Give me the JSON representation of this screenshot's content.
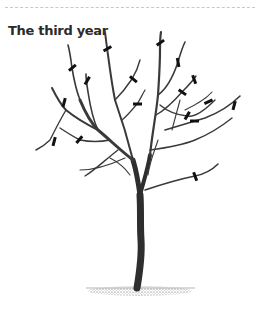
{
  "section": {
    "title": "The third year"
  },
  "figure": {
    "colors": {
      "branch": "#3a3a3a",
      "cut_mark": "#111111",
      "ground": "#555555"
    },
    "cut_marks": [
      {
        "x": 107,
        "y": 49,
        "angle": -30
      },
      {
        "x": 160,
        "y": 43,
        "angle": -35
      },
      {
        "x": 72,
        "y": 68,
        "angle": -40
      },
      {
        "x": 87,
        "y": 81,
        "angle": -60
      },
      {
        "x": 133,
        "y": 79,
        "angle": 40
      },
      {
        "x": 178,
        "y": 62,
        "angle": 80
      },
      {
        "x": 194,
        "y": 79,
        "angle": 70
      },
      {
        "x": 182,
        "y": 92,
        "angle": 35
      },
      {
        "x": 137,
        "y": 104,
        "angle": 0
      },
      {
        "x": 208,
        "y": 102,
        "angle": -25
      },
      {
        "x": 234,
        "y": 106,
        "angle": -75
      },
      {
        "x": 64,
        "y": 103,
        "angle": -75
      },
      {
        "x": 187,
        "y": 116,
        "angle": -60
      },
      {
        "x": 194,
        "y": 121,
        "angle": 0
      },
      {
        "x": 54,
        "y": 142,
        "angle": -75
      },
      {
        "x": 79,
        "y": 140,
        "angle": -50
      },
      {
        "x": 195,
        "y": 176,
        "angle": 70
      }
    ]
  }
}
